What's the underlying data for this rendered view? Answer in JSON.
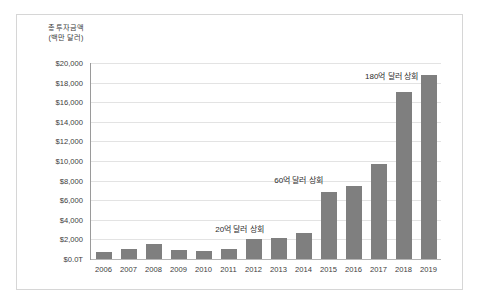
{
  "chart_data": {
    "type": "bar",
    "title": "",
    "subtitle": "",
    "xlabel": "",
    "ylabel": "총 투자금액\n(백만 달러)",
    "categories": [
      "2006",
      "2007",
      "2008",
      "2009",
      "2010",
      "2011",
      "2012",
      "2013",
      "2014",
      "2015",
      "2016",
      "2017",
      "2018",
      "2019"
    ],
    "values": [
      700,
      1000,
      1550,
      900,
      850,
      1050,
      2000,
      2150,
      2700,
      6800,
      7500,
      9650,
      17000,
      18800
    ],
    "series": [
      {
        "name": "총 투자금액",
        "values": [
          700,
          1000,
          1550,
          900,
          850,
          1050,
          2000,
          2150,
          2700,
          6800,
          7500,
          9650,
          17000,
          18800
        ]
      }
    ],
    "ylim": [
      0,
      20000
    ],
    "ytick_values": [
      0,
      2000,
      4000,
      6000,
      8000,
      10000,
      12000,
      14000,
      16000,
      18000,
      20000
    ],
    "ytick_labels": [
      "$0.0T",
      "$2,000",
      "$4,000",
      "$6,000",
      "$8,000",
      "$10,000",
      "$12,000",
      "$14,000",
      "$16,000",
      "$18,000",
      "$20,000"
    ],
    "grid": true,
    "legend": false,
    "legend_position": "none",
    "bar_color": "#7f7f7f",
    "gridline_color": "#e3e3e3",
    "axis_color": "#9a9a9a",
    "annotations": [
      {
        "text": "20억 달러 상회",
        "category": "2012",
        "value": 2000
      },
      {
        "text": "60억 달러 상회",
        "category": "2015",
        "value": 6800
      },
      {
        "text": "180억 달러 상회",
        "category": "2018",
        "value": 17000
      }
    ]
  },
  "frame": {
    "border_color": "#d6d6d6",
    "background": "#ffffff"
  }
}
